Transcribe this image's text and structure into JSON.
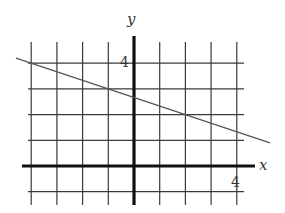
{
  "chart_data": {
    "type": "line",
    "title": "",
    "xlabel": "x",
    "ylabel": "y",
    "xlim": [
      -4.7,
      4.7
    ],
    "ylim": [
      -1.5,
      5.0
    ],
    "grid": true,
    "grid_step": 1,
    "tick_labels": {
      "x": [
        {
          "value": 4,
          "label": "4"
        }
      ],
      "y": [
        {
          "value": 4,
          "label": "4"
        }
      ]
    },
    "series": [
      {
        "name": "line",
        "equation": "y = -x/3 + 8/3",
        "slope": -0.3333,
        "intercept": 2.6667,
        "points": [
          {
            "x": -4,
            "y": 4
          },
          {
            "x": -1,
            "y": 3
          },
          {
            "x": 2,
            "y": 2
          },
          {
            "x": 4,
            "y": 1.3333
          }
        ]
      }
    ]
  },
  "labels": {
    "x_axis": "x",
    "y_axis": "y",
    "x_tick_4": "4",
    "y_tick_4": "4"
  },
  "colors": {
    "grid": "#3a3a3a",
    "axis": "#111111",
    "line": "#555555"
  }
}
